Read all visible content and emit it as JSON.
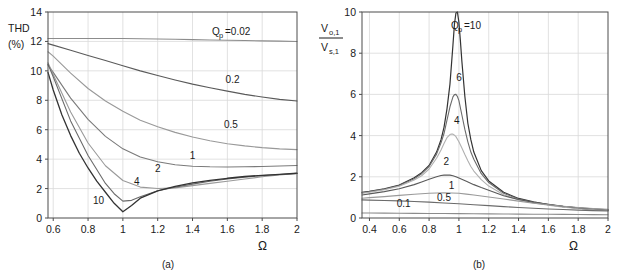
{
  "figure": {
    "panel_count": 2,
    "background": "#ffffff",
    "axis_color": "#4d4d4d",
    "grid_color": "#d9d9d9"
  },
  "panel_a": {
    "caption": "(a)",
    "ylabel_line1": "THD",
    "ylabel_line2": "(%)",
    "xlabel": "Ω",
    "legend_prefix": "Q",
    "legend_sub": "p",
    "legend_eq": "=0.02",
    "chart_data": {
      "type": "line",
      "title": "",
      "xlabel": "Ω",
      "ylabel": "THD (%)",
      "xlim": [
        0.57,
        2
      ],
      "ylim": [
        0,
        14
      ],
      "xticks": [
        0.6,
        0.8,
        1,
        1.2,
        1.4,
        1.6,
        1.8,
        2
      ],
      "xtick_labels": [
        "0.6",
        "0.8",
        "1",
        "1.2",
        "1.4",
        "1.6",
        "1.8",
        "2"
      ],
      "yticks": [
        0,
        2,
        4,
        6,
        8,
        10,
        12,
        14
      ],
      "ytick_labels": [
        "0",
        "2",
        "4",
        "6",
        "8",
        "10",
        "12",
        "14"
      ],
      "grid": true,
      "legend": "inline-curve-labels",
      "series": [
        {
          "name": "Qp = 0.02",
          "label": "0.02",
          "color": "#8c8c8c",
          "width": 1.1,
          "label_x": 1.5,
          "label_y": 12.95,
          "x": [
            0.57,
            0.6,
            0.7,
            0.8,
            0.9,
            1.0,
            1.1,
            1.2,
            1.3,
            1.4,
            1.5,
            1.6,
            1.7,
            1.8,
            1.9,
            2.0
          ],
          "y": [
            12.2,
            12.2,
            12.2,
            12.2,
            12.2,
            12.2,
            12.18,
            12.17,
            12.15,
            12.12,
            12.1,
            12.08,
            12.06,
            12.04,
            12.02,
            12.0
          ]
        },
        {
          "name": "Qp = 0.2",
          "label": "0.2",
          "color": "#5a5a5a",
          "width": 1.1,
          "label_x": 1.63,
          "label_y": 9.2,
          "x": [
            0.57,
            0.6,
            0.7,
            0.8,
            0.9,
            1.0,
            1.1,
            1.2,
            1.3,
            1.4,
            1.5,
            1.6,
            1.7,
            1.8,
            1.9,
            2.0
          ],
          "y": [
            11.85,
            11.75,
            11.4,
            11.05,
            10.7,
            10.35,
            10.0,
            9.68,
            9.38,
            9.1,
            8.85,
            8.62,
            8.4,
            8.22,
            8.06,
            7.95
          ]
        },
        {
          "name": "Qp = 0.5",
          "label": "0.5",
          "color": "#999999",
          "width": 1.1,
          "label_x": 1.62,
          "label_y": 6.15,
          "x": [
            0.57,
            0.6,
            0.7,
            0.8,
            0.9,
            1.0,
            1.1,
            1.2,
            1.3,
            1.4,
            1.5,
            1.6,
            1.7,
            1.8,
            1.9,
            2.0
          ],
          "y": [
            11.3,
            11.0,
            9.85,
            8.8,
            7.95,
            7.25,
            6.65,
            6.2,
            5.82,
            5.5,
            5.25,
            5.05,
            4.9,
            4.78,
            4.7,
            4.65
          ]
        },
        {
          "name": "Qp = 1",
          "label": "1",
          "color": "#7a7a7a",
          "width": 1.1,
          "label_x": 1.4,
          "label_y": 4.0,
          "x": [
            0.57,
            0.6,
            0.7,
            0.8,
            0.9,
            1.0,
            1.1,
            1.2,
            1.3,
            1.4,
            1.5,
            1.6,
            1.7,
            1.8,
            1.9,
            2.0
          ],
          "y": [
            10.4,
            9.9,
            8.15,
            6.7,
            5.55,
            4.7,
            4.15,
            3.82,
            3.62,
            3.52,
            3.48,
            3.47,
            3.48,
            3.5,
            3.53,
            3.57
          ]
        },
        {
          "name": "Qp = 2",
          "label": "2",
          "color": "#9a9a9a",
          "width": 1.1,
          "label_x": 1.2,
          "label_y": 3.1,
          "x": [
            0.57,
            0.6,
            0.7,
            0.8,
            0.9,
            1.0,
            1.1,
            1.2,
            1.3,
            1.4,
            1.5,
            1.6,
            1.7,
            1.8,
            1.9,
            2.0
          ],
          "y": [
            10.55,
            9.75,
            7.2,
            5.1,
            3.55,
            2.55,
            2.1,
            2.0,
            2.05,
            2.2,
            2.35,
            2.5,
            2.65,
            2.8,
            2.92,
            3.02
          ]
        },
        {
          "name": "Qp = 4",
          "label": "4",
          "color": "#6b6b6b",
          "width": 1.1,
          "label_x": 1.08,
          "label_y": 2.25,
          "x": [
            0.57,
            0.6,
            0.7,
            0.8,
            0.9,
            0.95,
            1.0,
            1.05,
            1.1,
            1.2,
            1.3,
            1.4,
            1.5,
            1.6,
            1.7,
            1.8,
            1.9,
            2.0
          ],
          "y": [
            10.45,
            9.6,
            6.6,
            4.25,
            2.35,
            1.65,
            1.15,
            1.2,
            1.45,
            1.85,
            2.1,
            2.3,
            2.5,
            2.65,
            2.78,
            2.88,
            2.96,
            3.03
          ]
        },
        {
          "name": "Qp = 10",
          "label": "10",
          "color": "#333333",
          "width": 1.3,
          "label_x": 0.86,
          "label_y": 0.95,
          "x": [
            0.57,
            0.6,
            0.65,
            0.7,
            0.75,
            0.8,
            0.85,
            0.9,
            0.95,
            1.0,
            1.05,
            1.1,
            1.2,
            1.3,
            1.4,
            1.5,
            1.6,
            1.7,
            1.8,
            1.9,
            2.0
          ],
          "y": [
            9.9,
            8.7,
            7.0,
            5.6,
            4.4,
            3.4,
            2.5,
            1.75,
            1.0,
            0.42,
            0.85,
            1.35,
            1.85,
            2.15,
            2.38,
            2.55,
            2.7,
            2.82,
            2.9,
            2.97,
            3.04
          ]
        }
      ]
    }
  },
  "panel_b": {
    "caption": "(b)",
    "ylabel_num": "V",
    "ylabel_num_sub": "o,1",
    "ylabel_den": "V",
    "ylabel_den_sub": "s,1",
    "xlabel": "Ω",
    "legend_prefix": "Q",
    "legend_sub": "p",
    "legend_eq": "=10",
    "chart_data": {
      "type": "line",
      "title": "",
      "xlabel": "Ω",
      "ylabel": "Vo,1 / Vs,1",
      "xlim": [
        0.35,
        2
      ],
      "ylim": [
        0,
        10
      ],
      "xticks": [
        0.4,
        0.6,
        0.8,
        1,
        1.2,
        1.4,
        1.6,
        1.8,
        2
      ],
      "xtick_labels": [
        "0.4",
        "0.6",
        "0.8",
        "1",
        "1.2",
        "1.4",
        "1.6",
        "1.8",
        "2"
      ],
      "yticks": [
        0,
        2,
        4,
        6,
        8,
        10
      ],
      "ytick_labels": [
        "0",
        "2",
        "4",
        "6",
        "8",
        "10"
      ],
      "grid": true,
      "legend": "inline-curve-labels",
      "series": [
        {
          "name": "Qp = 10",
          "label": "10",
          "color": "#333333",
          "width": 1.2,
          "label_x": 1.03,
          "label_y": 9.3,
          "x": [
            0.35,
            0.4,
            0.5,
            0.6,
            0.7,
            0.75,
            0.8,
            0.85,
            0.88,
            0.9,
            0.92,
            0.94,
            0.96,
            0.97,
            0.98,
            0.99,
            1.0,
            1.01,
            1.02,
            1.04,
            1.06,
            1.08,
            1.1,
            1.15,
            1.2,
            1.3,
            1.4,
            1.5,
            1.6,
            1.7,
            1.8,
            1.9,
            2.0
          ],
          "y": [
            1.25,
            1.3,
            1.42,
            1.6,
            1.95,
            2.2,
            2.55,
            3.2,
            3.8,
            4.4,
            5.3,
            6.5,
            8.4,
            9.4,
            9.95,
            10.0,
            9.5,
            8.6,
            7.6,
            5.9,
            4.6,
            3.8,
            3.2,
            2.3,
            1.8,
            1.25,
            0.95,
            0.78,
            0.65,
            0.55,
            0.48,
            0.42,
            0.38
          ]
        },
        {
          "name": "Qp = 6",
          "label": "6",
          "color": "#6b6b6b",
          "width": 1.1,
          "label_x": 1.0,
          "label_y": 6.65,
          "x": [
            0.35,
            0.4,
            0.5,
            0.6,
            0.7,
            0.75,
            0.8,
            0.85,
            0.88,
            0.9,
            0.92,
            0.94,
            0.96,
            0.97,
            0.98,
            0.99,
            1.0,
            1.02,
            1.04,
            1.06,
            1.08,
            1.1,
            1.15,
            1.2,
            1.3,
            1.4,
            1.5,
            1.6,
            1.7,
            1.8,
            1.9,
            2.0
          ],
          "y": [
            1.22,
            1.28,
            1.4,
            1.58,
            1.9,
            2.15,
            2.5,
            3.1,
            3.65,
            4.1,
            4.75,
            5.4,
            5.88,
            5.99,
            6.0,
            5.9,
            5.7,
            5.0,
            4.3,
            3.7,
            3.2,
            2.85,
            2.15,
            1.72,
            1.2,
            0.92,
            0.76,
            0.64,
            0.55,
            0.48,
            0.42,
            0.38
          ]
        },
        {
          "name": "Qp = 4",
          "label": "4",
          "color": "#b0b0b0",
          "width": 1.1,
          "label_x": 0.985,
          "label_y": 4.55,
          "x": [
            0.35,
            0.4,
            0.5,
            0.6,
            0.7,
            0.75,
            0.8,
            0.85,
            0.88,
            0.9,
            0.92,
            0.94,
            0.95,
            0.96,
            0.97,
            0.98,
            1.0,
            1.02,
            1.04,
            1.06,
            1.08,
            1.1,
            1.15,
            1.2,
            1.3,
            1.4,
            1.5,
            1.6,
            1.7,
            1.8,
            1.9,
            2.0
          ],
          "y": [
            1.2,
            1.25,
            1.37,
            1.54,
            1.84,
            2.05,
            2.38,
            2.9,
            3.3,
            3.62,
            3.9,
            4.05,
            4.08,
            4.07,
            4.02,
            3.95,
            3.7,
            3.4,
            3.08,
            2.78,
            2.5,
            2.28,
            1.86,
            1.55,
            1.13,
            0.88,
            0.73,
            0.62,
            0.53,
            0.46,
            0.41,
            0.37
          ]
        },
        {
          "name": "Qp = 2",
          "label": "2",
          "color": "#5a5a5a",
          "width": 1.1,
          "label_x": 0.915,
          "label_y": 2.55,
          "x": [
            0.35,
            0.4,
            0.5,
            0.6,
            0.7,
            0.75,
            0.8,
            0.85,
            0.88,
            0.9,
            0.92,
            0.94,
            0.96,
            0.98,
            1.0,
            1.05,
            1.1,
            1.15,
            1.2,
            1.3,
            1.4,
            1.5,
            1.6,
            1.7,
            1.8,
            1.9,
            2.0
          ],
          "y": [
            1.12,
            1.17,
            1.28,
            1.42,
            1.62,
            1.75,
            1.88,
            2.0,
            2.06,
            2.08,
            2.09,
            2.08,
            2.05,
            2.0,
            1.94,
            1.78,
            1.62,
            1.48,
            1.35,
            1.08,
            0.9,
            0.76,
            0.66,
            0.57,
            0.5,
            0.45,
            0.4
          ]
        },
        {
          "name": "Qp = 1",
          "label": "1",
          "color": "#9a9a9a",
          "width": 1.1,
          "label_x": 0.95,
          "label_y": 1.42,
          "x": [
            0.35,
            0.4,
            0.5,
            0.6,
            0.7,
            0.8,
            0.85,
            0.9,
            0.95,
            1.0,
            1.05,
            1.1,
            1.2,
            1.3,
            1.4,
            1.5,
            1.6,
            1.7,
            1.8,
            1.9,
            2.0
          ],
          "y": [
            0.96,
            0.99,
            1.04,
            1.1,
            1.15,
            1.2,
            1.21,
            1.22,
            1.21,
            1.2,
            1.16,
            1.12,
            1.02,
            0.92,
            0.82,
            0.72,
            0.64,
            0.57,
            0.51,
            0.46,
            0.42
          ]
        },
        {
          "name": "Qp = 0.5",
          "label": "0.5",
          "color": "#6b6b6b",
          "width": 1.1,
          "label_x": 0.9,
          "label_y": 0.82,
          "x": [
            0.35,
            0.4,
            0.5,
            0.6,
            0.7,
            0.8,
            0.9,
            1.0,
            1.1,
            1.2,
            1.3,
            1.4,
            1.5,
            1.6,
            1.7,
            1.8,
            1.9,
            2.0
          ],
          "y": [
            0.88,
            0.87,
            0.85,
            0.83,
            0.8,
            0.77,
            0.73,
            0.69,
            0.64,
            0.6,
            0.55,
            0.51,
            0.47,
            0.44,
            0.41,
            0.38,
            0.36,
            0.34
          ]
        },
        {
          "name": "Qp = 0.1",
          "label": "0.1",
          "color": "#8c8c8c",
          "width": 1.1,
          "label_x": 0.63,
          "label_y": 0.55,
          "x": [
            0.35,
            0.4,
            0.5,
            0.6,
            0.7,
            0.8,
            0.9,
            1.0,
            1.1,
            1.2,
            1.3,
            1.4,
            1.5,
            1.6,
            1.7,
            1.8,
            1.9,
            2.0
          ],
          "y": [
            0.24,
            0.24,
            0.235,
            0.23,
            0.225,
            0.22,
            0.215,
            0.21,
            0.205,
            0.2,
            0.195,
            0.19,
            0.185,
            0.18,
            0.175,
            0.17,
            0.165,
            0.16
          ]
        }
      ]
    }
  }
}
